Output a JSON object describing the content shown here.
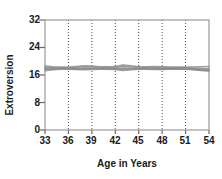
{
  "chart_data": {
    "type": "line",
    "title": "",
    "subtitle": "",
    "xlabel": "Age in Years",
    "ylabel": "Extroversion",
    "xlim": [
      33,
      54
    ],
    "ylim": [
      0,
      32
    ],
    "xticks": [
      33,
      36,
      39,
      42,
      45,
      48,
      51,
      54
    ],
    "yticks": [
      0,
      8,
      16,
      24,
      32
    ],
    "grid": "vertical-dotted",
    "legend": "none",
    "annotations": [],
    "series_color": "#8c8c8c",
    "x": [
      33,
      34,
      35,
      36,
      37,
      38,
      39,
      40,
      41,
      42,
      43,
      44,
      45,
      46,
      47,
      48,
      49,
      50,
      51,
      52,
      53,
      54
    ],
    "series": [
      {
        "name": "Trajectory 1",
        "values": [
          18.6,
          18.4,
          18.3,
          18.3,
          18.5,
          18.7,
          18.6,
          18.4,
          18.4,
          18.5,
          18.9,
          18.7,
          18.4,
          18.4,
          18.5,
          18.4,
          18.3,
          18.3,
          18.3,
          18.3,
          18.4,
          18.5
        ]
      },
      {
        "name": "Trajectory 2",
        "values": [
          18.2,
          18.1,
          18.1,
          18.1,
          18.2,
          18.4,
          18.3,
          18.2,
          18.2,
          18.2,
          18.5,
          18.3,
          18.2,
          18.2,
          18.2,
          18.2,
          18.1,
          18.1,
          18.1,
          18.0,
          17.9,
          17.8
        ]
      },
      {
        "name": "Trajectory 3",
        "values": [
          17.9,
          17.9,
          17.9,
          17.9,
          17.9,
          18.0,
          18.0,
          17.9,
          17.9,
          17.9,
          18.0,
          18.0,
          17.9,
          17.9,
          17.9,
          17.9,
          17.9,
          17.9,
          17.9,
          17.8,
          17.6,
          17.5
        ]
      },
      {
        "name": "Trajectory 4",
        "values": [
          17.6,
          17.7,
          17.8,
          17.8,
          17.7,
          17.7,
          17.8,
          17.8,
          17.8,
          17.7,
          17.6,
          17.7,
          17.8,
          17.8,
          17.7,
          17.7,
          17.8,
          17.8,
          17.8,
          17.6,
          17.4,
          17.3
        ]
      },
      {
        "name": "Trajectory 5",
        "values": [
          17.2,
          17.5,
          17.7,
          17.7,
          17.6,
          17.5,
          17.6,
          17.7,
          17.7,
          17.6,
          17.3,
          17.5,
          17.7,
          17.7,
          17.6,
          17.6,
          17.7,
          17.7,
          17.7,
          17.5,
          17.3,
          17.2
        ]
      }
    ]
  },
  "axis": {
    "y_ticks": [
      {
        "value": "32"
      },
      {
        "value": "24"
      },
      {
        "value": "16"
      },
      {
        "value": "8"
      },
      {
        "value": "0"
      }
    ],
    "x_ticks": [
      {
        "value": "33"
      },
      {
        "value": "36"
      },
      {
        "value": "39"
      },
      {
        "value": "42"
      },
      {
        "value": "45"
      },
      {
        "value": "48"
      },
      {
        "value": "51"
      },
      {
        "value": "54"
      }
    ],
    "x_axis_title": "Age in Years",
    "y_axis_title": "Extroversion"
  }
}
